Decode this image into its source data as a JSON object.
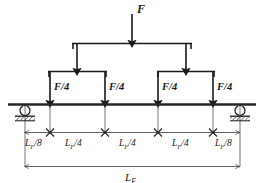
{
  "figure": {
    "type": "engineering-beam-diagram"
  },
  "colors": {
    "line": "#1a1a1a",
    "beam": "#262626",
    "background": "#ffffff",
    "dimension": "#3a3a3a"
  },
  "loads": {
    "applied": {
      "label_html": "F",
      "label": "F",
      "magnitude": "F",
      "position_x": 132
    },
    "points": [
      {
        "label": "F/4",
        "magnitude": "F/4",
        "position_x": 50
      },
      {
        "label": "F/4",
        "magnitude": "F/4",
        "position_x": 105
      },
      {
        "label": "F/4",
        "magnitude": "F/4",
        "position_x": 158
      },
      {
        "label": "F/4",
        "magnitude": "F/4",
        "position_x": 213
      }
    ],
    "intermediate": [
      {
        "magnitude": "F/2",
        "position_x": 77
      },
      {
        "magnitude": "F/2",
        "position_x": 186
      }
    ]
  },
  "dimensions": {
    "segments": [
      {
        "label_L": "L",
        "label_sub": "F",
        "label_rest": "/8",
        "text": "L_F/8",
        "value": "LF/8",
        "from_x": 25,
        "to_x": 50
      },
      {
        "label_L": "L",
        "label_sub": "F",
        "label_rest": "/4",
        "text": "L_F/4",
        "value": "LF/4",
        "from_x": 50,
        "to_x": 105
      },
      {
        "label_L": "L",
        "label_sub": "F",
        "label_rest": "/4",
        "text": "L_F/4",
        "value": "LF/4",
        "from_x": 105,
        "to_x": 158
      },
      {
        "label_L": "L",
        "label_sub": "F",
        "label_rest": "/4",
        "text": "L_F/4",
        "value": "LF/4",
        "from_x": 158,
        "to_x": 213
      },
      {
        "label_L": "L",
        "label_sub": "F",
        "label_rest": "/8",
        "text": "L_F/8",
        "value": "LF/8",
        "from_x": 213,
        "to_x": 240
      }
    ],
    "total_span": {
      "label_L": "L",
      "label_sub": "F",
      "text": "L_F",
      "value": "LF",
      "from_x": 25,
      "to_x": 240
    }
  },
  "supports": [
    {
      "type": "roller",
      "position_x": 25
    },
    {
      "type": "roller",
      "position_x": 240
    }
  ],
  "beam": {
    "from_x": 8,
    "to_x": 256,
    "y": 104
  }
}
